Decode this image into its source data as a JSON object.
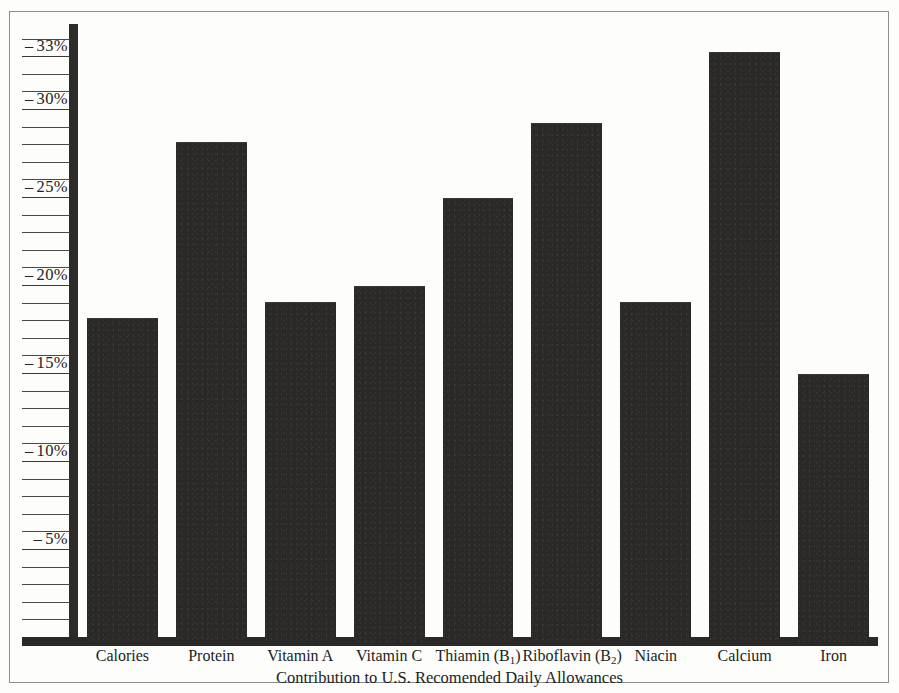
{
  "chart_data": {
    "type": "bar",
    "title": "",
    "caption": "Contribution to U.S. Recomended Daily Allowances",
    "xlabel": "",
    "ylabel": "",
    "ylim": [
      0,
      34
    ],
    "grid": false,
    "y_tick_interval": 1,
    "y_tick_labels": [
      {
        "value": 33,
        "text": "33%"
      },
      {
        "value": 30,
        "text": "30%"
      },
      {
        "value": 25,
        "text": "25%"
      },
      {
        "value": 20,
        "text": "20%"
      },
      {
        "value": 15,
        "text": "15%"
      },
      {
        "value": 10,
        "text": "10%"
      },
      {
        "value": 5,
        "text": "5%"
      }
    ],
    "tick_dash": "–",
    "categories": [
      "Calories",
      "Protein",
      "Vitamin A",
      "Vitamin C",
      "Thiamin (B1)",
      "Riboflavin (B2)",
      "Niacin",
      "Calcium",
      "Iron"
    ],
    "category_labels": [
      {
        "text": "Calories",
        "sub": ""
      },
      {
        "text": "Protein",
        "sub": ""
      },
      {
        "text": "Vitamin A",
        "sub": ""
      },
      {
        "text": "Vitamin C",
        "sub": ""
      },
      {
        "text": "Thiamin (B",
        "sub": "1",
        "tail": ")"
      },
      {
        "text": "Riboflavin (B",
        "sub": "2",
        "tail": ")"
      },
      {
        "text": "Niacin",
        "sub": ""
      },
      {
        "text": "Calcium",
        "sub": ""
      },
      {
        "text": "Iron",
        "sub": ""
      }
    ],
    "values": [
      18.4,
      28.4,
      19.3,
      20.2,
      25.2,
      29.5,
      19.3,
      33.5,
      15.2
    ],
    "bar_color": "#2b2928",
    "axis_color": "#2b2928",
    "background_color": "#fdfdfc"
  }
}
